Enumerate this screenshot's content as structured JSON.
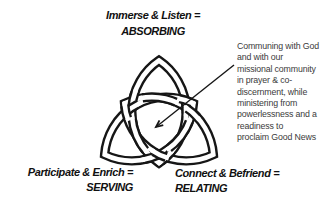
{
  "background": "#ffffff",
  "colors": {
    "knot_line": "#161616",
    "band_fill": "#ffffff",
    "label_text": "#111111",
    "annotation_text": "#3b3b3b"
  },
  "labels": {
    "top": {
      "line1": "Immerse & Listen =",
      "line2": "ABSORBING"
    },
    "bottom_left": {
      "line1": "Participate & Enrich =",
      "line2": "SERVING"
    },
    "bottom_right": {
      "line1": "Connect & Befriend =",
      "line2": "RELATING"
    }
  },
  "annotation": {
    "text": "Communing with God\nand with our\nmissional community\nin prayer & co-\ndiscernment, while\nministering from\npowerlessness and a\nreadiness to\nproclaim Good News"
  },
  "diagram": {
    "symbol": "triquetra-trinity-knot",
    "arrow": {
      "x1": 234,
      "y1": 65,
      "x2": 156,
      "y2": 127
    }
  }
}
